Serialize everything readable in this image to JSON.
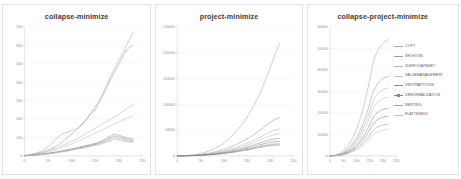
{
  "figure": {
    "background_color": "#ffffff",
    "panel_border_color": "#e2e2e2",
    "grid_color": "#ededed",
    "axis_color": "#cfcfcf",
    "tick_text_color": "#8a8a8a",
    "title_color": "#3c3c3c"
  },
  "chart_data": [
    {
      "type": "line",
      "title": "collapse-minimize",
      "xlabel": "",
      "ylabel": "",
      "xlim": [
        0,
        250
      ],
      "ylim": [
        0,
        700
      ],
      "xticks": [
        0,
        50,
        100,
        150,
        200,
        250
      ],
      "yticks": [
        0,
        100,
        200,
        300,
        400,
        500,
        600,
        700
      ],
      "grid": true,
      "legend": "none",
      "x": [
        0,
        10,
        20,
        30,
        40,
        50,
        60,
        70,
        80,
        90,
        100,
        110,
        120,
        130,
        140,
        150,
        160,
        170,
        180,
        190,
        200,
        210,
        220,
        230
      ],
      "series": [
        {
          "name": "COPY",
          "color": "#a9a9a9",
          "values": [
            3,
            6,
            12,
            20,
            32,
            50,
            72,
            100,
            120,
            128,
            138,
            148,
            168,
            196,
            232,
            268,
            310,
            360,
            420,
            470,
            520,
            570,
            620,
            672
          ]
        },
        {
          "name": "SELFJOIN",
          "color": "#9c9c9c",
          "values": [
            2,
            5,
            9,
            15,
            22,
            32,
            44,
            58,
            76,
            98,
            120,
            140,
            165,
            196,
            228,
            250,
            300,
            350,
            402,
            452,
            500,
            550,
            585,
            600
          ]
        },
        {
          "name": "SURROGATEKEY",
          "color": "#b5b5b5",
          "values": [
            2,
            4,
            8,
            13,
            19,
            26,
            35,
            45,
            56,
            68,
            80,
            92,
            106,
            120,
            135,
            150,
            165,
            180,
            196,
            210,
            225,
            245,
            262,
            278
          ]
        },
        {
          "name": "VALUEMANAGEMENT",
          "color": "#bdbdbd",
          "values": [
            2,
            4,
            7,
            11,
            16,
            22,
            29,
            37,
            46,
            56,
            66,
            77,
            88,
            100,
            112,
            124,
            136,
            148,
            160,
            172,
            184,
            196,
            208,
            218
          ]
        },
        {
          "name": "VERTPARTITION",
          "color": "#8f8f8f",
          "values": [
            1,
            3,
            5,
            8,
            11,
            15,
            19,
            23,
            28,
            33,
            38,
            44,
            50,
            56,
            62,
            68,
            78,
            90,
            104,
            118,
            112,
            104,
            96,
            92
          ]
        },
        {
          "name": "DENORMALIZATION",
          "color": "#868686",
          "values": [
            1,
            3,
            5,
            7,
            10,
            13,
            17,
            21,
            25,
            30,
            35,
            40,
            46,
            52,
            58,
            64,
            72,
            82,
            94,
            108,
            102,
            95,
            88,
            84
          ]
        },
        {
          "name": "NESTING",
          "color": "#a0a0a0",
          "values": [
            1,
            2,
            4,
            6,
            9,
            12,
            15,
            19,
            23,
            27,
            32,
            37,
            42,
            48,
            54,
            60,
            66,
            74,
            84,
            96,
            92,
            86,
            80,
            78
          ]
        },
        {
          "name": "FLATTENING",
          "color": "#c2c2c2",
          "values": [
            1,
            2,
            4,
            6,
            8,
            11,
            14,
            18,
            22,
            26,
            30,
            35,
            40,
            45,
            50,
            56,
            62,
            70,
            78,
            88,
            84,
            78,
            74,
            72
          ]
        }
      ]
    },
    {
      "type": "line",
      "title": "project-minimize",
      "xlabel": "",
      "ylabel": "",
      "xlim": [
        0,
        250
      ],
      "ylim": [
        0,
        250000
      ],
      "xticks": [
        0,
        50,
        100,
        150,
        200,
        250
      ],
      "yticks": [
        0,
        50000,
        100000,
        150000,
        200000,
        250000
      ],
      "grid": true,
      "legend": "none",
      "x": [
        0,
        10,
        20,
        30,
        40,
        50,
        60,
        70,
        80,
        90,
        100,
        110,
        120,
        130,
        140,
        150,
        160,
        170,
        180,
        190,
        200,
        210,
        220
      ],
      "series": [
        {
          "name": "COPY",
          "color": "#a9a9a9",
          "values": [
            100,
            300,
            800,
            1600,
            2800,
            4600,
            7000,
            10000,
            14000,
            19000,
            25000,
            32500,
            41000,
            51000,
            62000,
            75000,
            90000,
            107000,
            126000,
            148000,
            172000,
            196000,
            218000
          ]
        },
        {
          "name": "SELFJOIN",
          "color": "#9c9c9c",
          "values": [
            80,
            220,
            520,
            1000,
            1700,
            2700,
            4000,
            5600,
            7600,
            10000,
            12800,
            16000,
            19600,
            23600,
            28000,
            33000,
            38500,
            44500,
            51000,
            58000,
            65000,
            71000,
            74000
          ]
        },
        {
          "name": "SURROGATEKEY",
          "color": "#b5b5b5",
          "values": [
            70,
            190,
            440,
            840,
            1400,
            2200,
            3200,
            4400,
            5900,
            7700,
            9800,
            12200,
            14900,
            17900,
            21200,
            24800,
            28700,
            32900,
            37400,
            42000,
            46500,
            50000,
            52000
          ]
        },
        {
          "name": "VALUEMANAGEMENT",
          "color": "#bdbdbd",
          "values": [
            60,
            160,
            380,
            720,
            1200,
            1900,
            2750,
            3800,
            5100,
            6600,
            8400,
            10400,
            12700,
            15200,
            18000,
            21000,
            24300,
            27800,
            31500,
            35400,
            39000,
            41500,
            43000
          ]
        },
        {
          "name": "VERTPARTITION",
          "color": "#8f8f8f",
          "values": [
            50,
            140,
            320,
            610,
            1020,
            1600,
            2320,
            3200,
            4250,
            5500,
            6950,
            8600,
            10450,
            12500,
            14750,
            17200,
            19850,
            22700,
            25700,
            28800,
            31500,
            33000,
            34000
          ]
        },
        {
          "name": "DENORMALIZATION",
          "color": "#868686",
          "values": [
            45,
            120,
            280,
            530,
            890,
            1390,
            2020,
            2790,
            3700,
            4780,
            6030,
            7450,
            9050,
            10820,
            12750,
            14850,
            17100,
            19500,
            22000,
            24500,
            26500,
            27600,
            28200
          ]
        },
        {
          "name": "NESTING",
          "color": "#a0a0a0",
          "values": [
            40,
            105,
            245,
            465,
            775,
            1210,
            1760,
            2430,
            3220,
            4160,
            5240,
            6470,
            7850,
            9380,
            11050,
            12850,
            14800,
            16850,
            19000,
            21000,
            22600,
            23400,
            23800
          ]
        },
        {
          "name": "FLATTENING",
          "color": "#707070",
          "values": [
            35,
            95,
            220,
            420,
            700,
            1090,
            1580,
            2180,
            2890,
            3730,
            4700,
            5800,
            7030,
            8400,
            9900,
            11500,
            13250,
            15100,
            17000,
            18800,
            20200,
            21000,
            21400
          ]
        }
      ]
    },
    {
      "type": "line",
      "title": "collapse-project-minimize",
      "xlabel": "",
      "ylabel": "",
      "xlim": [
        0,
        250
      ],
      "ylim": [
        0,
        60000
      ],
      "xticks": [
        0,
        50,
        100,
        150,
        200,
        250
      ],
      "yticks": [
        0,
        10000,
        20000,
        30000,
        40000,
        50000,
        60000
      ],
      "grid": true,
      "legend": "right",
      "x": [
        0,
        10,
        20,
        30,
        40,
        50,
        60,
        70,
        80,
        90,
        100,
        110,
        120,
        130,
        140,
        150,
        160,
        170,
        180,
        190,
        200,
        210,
        220
      ],
      "series": [
        {
          "name": "COPY",
          "color": "#a9a9a9",
          "values": [
            40,
            150,
            400,
            820,
            1450,
            2350,
            3550,
            5100,
            7050,
            9450,
            12350,
            15800,
            19800,
            24400,
            29600,
            35400,
            41800,
            46200,
            49000,
            51000,
            52500,
            53500,
            54200
          ]
        },
        {
          "name": "SELFJOIN",
          "color": "#9c9c9c",
          "values": [
            30,
            100,
            270,
            560,
            990,
            1600,
            2420,
            3480,
            4820,
            6460,
            8440,
            10800,
            13550,
            16700,
            20250,
            24200,
            28550,
            31700,
            33600,
            35000,
            36000,
            36600,
            37000
          ]
        },
        {
          "name": "SURROGATEKEY",
          "color": "#b5b5b5",
          "values": [
            25,
            85,
            230,
            480,
            850,
            1370,
            2070,
            2980,
            4130,
            5530,
            7230,
            9250,
            11600,
            14300,
            17350,
            20750,
            24450,
            27200,
            28800,
            30000,
            30800,
            31300,
            31600
          ]
        },
        {
          "name": "VALUEMANAGEMENT",
          "color": "#bdbdbd",
          "values": [
            22,
            74,
            200,
            415,
            735,
            1185,
            1790,
            2580,
            3570,
            4780,
            6250,
            8000,
            10030,
            12360,
            15000,
            17940,
            21150,
            23550,
            24950,
            26000,
            26700,
            27100,
            27400
          ]
        },
        {
          "name": "VERTPARTITION",
          "color": "#8f8f8f",
          "values": [
            18,
            60,
            162,
            336,
            595,
            960,
            1450,
            2090,
            2890,
            3870,
            5060,
            6480,
            8120,
            10000,
            12140,
            14520,
            17120,
            19060,
            20200,
            21050,
            21600,
            21950,
            22150
          ]
        },
        {
          "name": "DENORMALIZATION",
          "color": "#868686",
          "values": [
            15,
            50,
            135,
            280,
            495,
            800,
            1210,
            1740,
            2410,
            3230,
            4220,
            5400,
            6770,
            8340,
            10120,
            12100,
            14270,
            15890,
            16840,
            17550,
            18000,
            18300,
            18450
          ]
        },
        {
          "name": "NESTING",
          "color": "#a0a0a0",
          "values": [
            12,
            40,
            108,
            224,
            396,
            640,
            967,
            1392,
            1928,
            2583,
            3376,
            4320,
            5415,
            6670,
            8095,
            9680,
            11415,
            12710,
            13470,
            14040,
            14400,
            14640,
            14760
          ]
        },
        {
          "name": "FLATTENING",
          "color": "#c2c2c2",
          "values": [
            10,
            33,
            90,
            186,
            330,
            533,
            806,
            1160,
            1607,
            2153,
            2813,
            3600,
            4512,
            5558,
            6746,
            8067,
            9512,
            10592,
            11225,
            11700,
            12000,
            12200,
            12300
          ]
        }
      ],
      "legend_entries": [
        {
          "label": "COPY",
          "color": "#a9a9a9",
          "marker": "none"
        },
        {
          "label": "SELFJOIN",
          "color": "#9c9c9c",
          "marker": "none"
        },
        {
          "label": "SURROGATEKEY",
          "color": "#b5b5b5",
          "marker": "none"
        },
        {
          "label": "VALUEMANAGEMENT",
          "color": "#bdbdbd",
          "marker": "none"
        },
        {
          "label": "VERTPARTITION",
          "color": "#8f8f8f",
          "marker": "none"
        },
        {
          "label": "DENORMALIZATION",
          "color": "#868686",
          "marker": "square"
        },
        {
          "label": "NESTING",
          "color": "#a0a0a0",
          "marker": "none"
        },
        {
          "label": "FLATTENING",
          "color": "#c2c2c2",
          "marker": "none"
        }
      ]
    }
  ]
}
